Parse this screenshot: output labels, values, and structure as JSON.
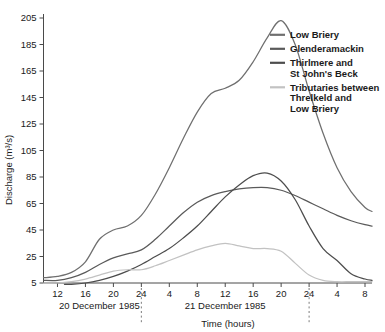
{
  "chart_data": {
    "type": "line",
    "title": "",
    "xlabel": "Time (hours)",
    "ylabel": "Discharge (m³/s)",
    "ylim": [
      5,
      205
    ],
    "yticks": [
      5,
      25,
      45,
      65,
      85,
      105,
      125,
      145,
      165,
      185,
      205
    ],
    "xlim": [
      10,
      32
    ],
    "xticks": [
      12,
      16,
      20,
      24,
      4,
      8,
      12,
      16,
      20,
      24,
      4,
      8
    ],
    "xtick_hours_absolute": [
      12,
      16,
      20,
      24,
      28,
      32,
      36,
      40,
      44,
      48,
      52,
      56
    ],
    "grid": false,
    "legend_position": "top-right",
    "date_labels": [
      {
        "text": "20 December 1985",
        "at_hour": 18
      },
      {
        "text": "21 December 1985",
        "at_hour": 36
      }
    ],
    "day_boundary_markers": [
      24,
      48
    ],
    "series": [
      {
        "name": "Low Briery",
        "color": "#6f6f6f",
        "x": [
          10,
          12,
          14,
          16,
          18,
          20,
          22,
          24,
          26,
          28,
          30,
          32,
          34,
          36,
          38,
          40,
          42,
          44,
          46,
          48,
          50,
          52,
          54,
          56,
          57
        ],
        "values": [
          9,
          10,
          13,
          21,
          38,
          45,
          48,
          56,
          72,
          92,
          114,
          134,
          148,
          152,
          158,
          172,
          190,
          203,
          185,
          150,
          118,
          92,
          74,
          62,
          59
        ]
      },
      {
        "name": "Glenderamackin",
        "color": "#5a5a5a",
        "x": [
          10,
          12,
          14,
          16,
          18,
          20,
          22,
          24,
          26,
          28,
          30,
          32,
          34,
          36,
          38,
          40,
          42,
          44,
          46,
          48,
          50,
          52,
          54,
          56,
          57
        ],
        "values": [
          7,
          7,
          9,
          13,
          19,
          24,
          27,
          30,
          38,
          48,
          58,
          66,
          71,
          74,
          76,
          77,
          77,
          75,
          71,
          66,
          61,
          56,
          52,
          49,
          48
        ]
      },
      {
        "name": "Thirlmere and St John's Beck",
        "color": "#4d4d4d",
        "x": [
          13,
          14,
          16,
          18,
          20,
          22,
          24,
          26,
          28,
          30,
          32,
          34,
          36,
          38,
          40,
          42,
          44,
          46,
          48,
          50,
          52,
          54,
          56,
          57
        ],
        "values": [
          4,
          4,
          5,
          7,
          10,
          14,
          19,
          25,
          31,
          39,
          48,
          59,
          70,
          79,
          86,
          88,
          82,
          68,
          48,
          31,
          22,
          12,
          8,
          7
        ]
      },
      {
        "name": "Tributaries between Threlkeld and Low Briery",
        "color": "#c2c2c2",
        "x": [
          10,
          12,
          14,
          16,
          18,
          20,
          22,
          24,
          26,
          28,
          30,
          32,
          34,
          36,
          38,
          40,
          42,
          44,
          46,
          48,
          50,
          52,
          54,
          56,
          57
        ],
        "values": [
          5,
          5,
          6,
          8,
          11,
          14,
          15,
          15,
          18,
          22,
          26,
          30,
          33,
          35,
          33,
          31,
          31,
          29,
          20,
          11,
          7,
          6,
          6,
          6,
          6
        ]
      }
    ],
    "legend": [
      {
        "label": "Low Briery",
        "label_lines": [
          "Low Briery"
        ],
        "color": "#6f6f6f"
      },
      {
        "label": "Glenderamackin",
        "label_lines": [
          "Glenderamackin"
        ],
        "color": "#5a5a5a"
      },
      {
        "label": "Thirlmere and St John's Beck",
        "label_lines": [
          "Thirlmere and",
          "St John's Beck"
        ],
        "color": "#4d4d4d"
      },
      {
        "label": "Tributaries between Threlkeld and Low Briery",
        "label_lines": [
          "Tributaries between",
          "Threlkeld and",
          "Low Briery"
        ],
        "color": "#c2c2c2"
      }
    ]
  }
}
